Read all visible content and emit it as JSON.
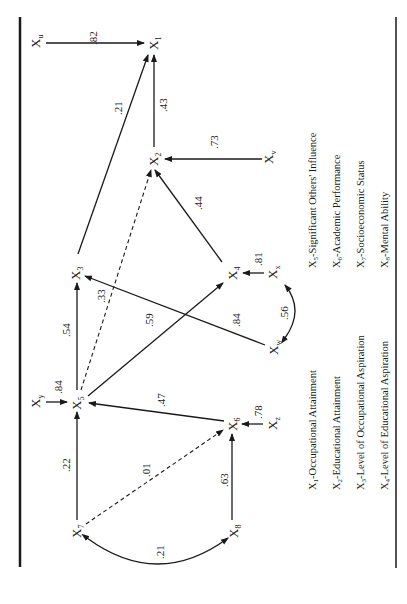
{
  "diagram": {
    "type": "path-diagram",
    "orientation": "rotated-90-ccw",
    "nodes": [
      {
        "id": "Xu",
        "base": "X",
        "sub": "u"
      },
      {
        "id": "X1",
        "base": "X",
        "sub": "1"
      },
      {
        "id": "X2",
        "base": "X",
        "sub": "2"
      },
      {
        "id": "Xv",
        "base": "X",
        "sub": "v"
      },
      {
        "id": "X3",
        "base": "X",
        "sub": "3"
      },
      {
        "id": "X4",
        "base": "X",
        "sub": "4"
      },
      {
        "id": "Xx",
        "base": "X",
        "sub": "x"
      },
      {
        "id": "Xw",
        "base": "X",
        "sub": "w"
      },
      {
        "id": "X5",
        "base": "X",
        "sub": "5"
      },
      {
        "id": "Xy",
        "base": "X",
        "sub": "y"
      },
      {
        "id": "X6",
        "base": "X",
        "sub": "6"
      },
      {
        "id": "Xz",
        "base": "X",
        "sub": "z"
      },
      {
        "id": "X7",
        "base": "X",
        "sub": "7"
      },
      {
        "id": "X8",
        "base": "X",
        "sub": "8"
      }
    ],
    "edges": [
      {
        "from": "Xu",
        "to": "X1",
        "coef": ".82",
        "style": "solid"
      },
      {
        "from": "X2",
        "to": "X1",
        "coef": ".43",
        "style": "solid"
      },
      {
        "from": "X3",
        "to": "X1",
        "coef": ".21",
        "style": "solid"
      },
      {
        "from": "Xv",
        "to": "X2",
        "coef": ".73",
        "style": "solid"
      },
      {
        "from": "X4",
        "to": "X2",
        "coef": ".44",
        "style": "solid"
      },
      {
        "from": "X5",
        "to": "X2",
        "coef": ".33",
        "style": "dashed"
      },
      {
        "from": "X5",
        "to": "X3",
        "coef": ".54",
        "style": "solid"
      },
      {
        "from": "Xw",
        "to": "X3",
        "coef": ".84",
        "style": "solid"
      },
      {
        "from": "X5",
        "to": "X4",
        "coef": ".59",
        "style": "solid"
      },
      {
        "from": "Xx",
        "to": "X4",
        "coef": ".81",
        "style": "solid"
      },
      {
        "from": "Xw",
        "to": "Xx",
        "coef": ".56",
        "style": "curved-double"
      },
      {
        "from": "Xy",
        "to": "X5",
        "coef": ".84",
        "style": "solid"
      },
      {
        "from": "X6",
        "to": "X5",
        "coef": ".47",
        "style": "solid"
      },
      {
        "from": "X7",
        "to": "X5",
        "coef": ".22",
        "style": "solid"
      },
      {
        "from": "Xz",
        "to": "X6",
        "coef": ".78",
        "style": "solid"
      },
      {
        "from": "X7",
        "to": "X6",
        "coef": ".01",
        "style": "dashed"
      },
      {
        "from": "X8",
        "to": "X6",
        "coef": ".63",
        "style": "solid"
      },
      {
        "from": "X7",
        "to": "X8",
        "coef": ".21",
        "style": "curved-double"
      }
    ]
  },
  "legend": {
    "left": [
      {
        "base": "X",
        "sub": "1",
        "text": "-Occupational Attainment"
      },
      {
        "base": "X",
        "sub": "2",
        "text": "-Educational Attainment"
      },
      {
        "base": "X",
        "sub": "3",
        "text": "-Level of Occupational Aspiration"
      },
      {
        "base": "X",
        "sub": "4",
        "text": "-Level of Educational Aspiration"
      }
    ],
    "right": [
      {
        "base": "X",
        "sub": "5",
        "text": "-Significant Others' Influence"
      },
      {
        "base": "X",
        "sub": "6",
        "text": "-Academic Performance"
      },
      {
        "base": "X",
        "sub": "7",
        "text": "-Socioeconomic Status"
      },
      {
        "base": "X",
        "sub": "8",
        "text": "-Mental Ability"
      }
    ]
  }
}
